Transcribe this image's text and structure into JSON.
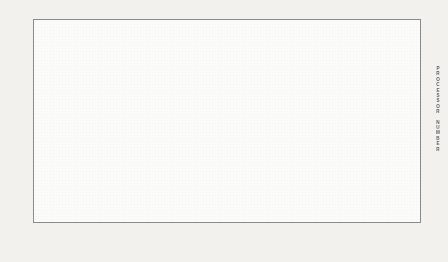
{
  "chart_data": {
    "type": "heatmap",
    "xlabel": "TIME",
    "ylabel": "PROCESSOR NUMBER",
    "xlim": [
      182,
      287
    ],
    "x_tick_labels": [
      "182",
      "287"
    ],
    "ylim": [
      0,
      9
    ],
    "y_tick_labels": [
      "9",
      "8",
      "7",
      "6",
      "5",
      "4",
      "3",
      "2",
      "1",
      "0"
    ],
    "grid": false,
    "legend_position": "bottom",
    "legend_title": "",
    "legend_entries": [
      {
        "label": "0",
        "pattern": "solid-dark-gray",
        "color": "#6b6b6b"
      },
      {
        "label": "1",
        "pattern": "solid-mid-gray",
        "color": "#9a9a9a"
      },
      {
        "label": "2",
        "pattern": "solid-white",
        "color": "#fbfbf9"
      },
      {
        "label": "3",
        "pattern": "fine-stipple",
        "color": "#dcdcda"
      },
      {
        "label": "4",
        "pattern": "solid-darkest-gray",
        "color": "#575757"
      },
      {
        "label": "5",
        "pattern": "coarse-dotted",
        "color": "#cfcfcd"
      },
      {
        "label": "6",
        "pattern": "horizontal-lines",
        "color": "#7c7c7c"
      },
      {
        "label": "7",
        "pattern": "wide-diagonal-hatch",
        "color": "#7c7c7c"
      },
      {
        "label": "8",
        "pattern": "solid-light-gray",
        "color": "#b2b2b2"
      },
      {
        "label": "9",
        "pattern": "dense-diagonal-hatch",
        "color": "#8a8a8a"
      }
    ],
    "columns": 24,
    "rows": 10,
    "row_labels": [
      "9",
      "8",
      "7",
      "6",
      "5",
      "4",
      "3",
      "2",
      "1",
      "0"
    ],
    "matrix": [
      [
        3,
        8,
        4,
        2,
        8,
        6,
        7,
        1,
        9,
        7,
        0,
        2,
        4,
        1,
        8,
        0,
        9,
        7,
        3,
        9,
        1,
        3,
        0,
        8
      ],
      [
        4,
        2,
        8,
        1,
        7,
        9,
        3,
        8,
        7,
        0,
        2,
        5,
        1,
        8,
        4,
        9,
        3,
        7,
        6,
        1,
        9,
        4,
        8,
        2
      ],
      [
        2,
        9,
        8,
        1,
        7,
        3,
        2,
        0,
        8,
        4,
        1,
        5,
        3,
        9,
        7,
        1,
        8,
        0,
        7,
        4,
        9,
        2,
        3,
        8
      ],
      [
        8,
        6,
        1,
        9,
        7,
        2,
        4,
        8,
        3,
        1,
        0,
        7,
        9,
        5,
        2,
        8,
        6,
        3,
        7,
        4,
        1,
        2,
        9,
        4
      ],
      [
        5,
        6,
        9,
        7,
        1,
        8,
        3,
        0,
        1,
        5,
        9,
        6,
        7,
        2,
        8,
        4,
        2,
        1,
        9,
        3,
        8,
        0,
        1,
        4
      ],
      [
        7,
        9,
        3,
        0,
        8,
        1,
        3,
        5,
        2,
        6,
        9,
        7,
        1,
        8,
        4,
        2,
        0,
        9,
        3,
        8,
        7,
        5,
        4,
        1
      ],
      [
        9,
        3,
        8,
        0,
        1,
        7,
        4,
        9,
        6,
        2,
        5,
        8,
        3,
        7,
        1,
        9,
        2,
        3,
        8,
        5,
        0,
        4,
        9,
        7
      ],
      [
        2,
        8,
        4,
        1,
        9,
        0,
        7,
        5,
        3,
        9,
        6,
        1,
        8,
        7,
        2,
        4,
        0,
        8,
        3,
        6,
        9,
        1,
        7,
        8
      ],
      [
        9,
        4,
        1,
        8,
        0,
        5,
        3,
        7,
        9,
        2,
        6,
        8,
        1,
        4,
        0,
        2,
        9,
        3,
        5,
        7,
        8,
        1,
        6,
        0
      ],
      [
        3,
        8,
        1,
        4,
        2,
        6,
        9,
        7,
        5,
        0,
        8,
        3,
        1,
        9,
        4,
        2,
        7,
        8,
        6,
        9,
        1,
        5,
        3,
        0
      ]
    ]
  }
}
